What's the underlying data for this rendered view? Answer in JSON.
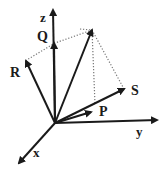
{
  "diagram": {
    "type": "3d-vector-diagram",
    "stroke_color": "#1a1a1a",
    "dotted_color": "#777777",
    "origin": [
      55,
      123
    ],
    "axes": [
      {
        "id": "z",
        "label": "z",
        "tip": [
          53,
          10
        ],
        "label_pos": [
          40,
          22
        ]
      },
      {
        "id": "y",
        "label": "y",
        "tip": [
          157,
          120
        ],
        "label_pos": [
          136,
          136
        ]
      },
      {
        "id": "x",
        "label": "x",
        "tip": [
          19,
          163
        ],
        "label_pos": [
          33,
          157
        ]
      }
    ],
    "vectors": [
      {
        "id": "Q",
        "label": "Q",
        "tip": [
          54,
          43
        ],
        "label_pos": [
          37,
          41
        ]
      },
      {
        "id": "R",
        "label": "R",
        "tip": [
          26,
          61
        ],
        "label_pos": [
          10,
          77
        ]
      },
      {
        "id": "S",
        "label": "S",
        "tip": [
          124,
          89
        ],
        "label_pos": [
          131,
          95
        ]
      },
      {
        "id": "P",
        "label": "P",
        "tip": [
          91,
          112
        ],
        "label_pos": [
          99,
          116
        ]
      },
      {
        "id": "resultant",
        "label": "",
        "tip": [
          92,
          30
        ],
        "label_pos": null
      }
    ],
    "dotted_lines": [
      {
        "from": [
          92,
          30
        ],
        "to": [
          55,
          43
        ]
      },
      {
        "from": [
          55,
          43
        ],
        "to": [
          25,
          61
        ]
      },
      {
        "from": [
          92,
          30
        ],
        "to": [
          95,
          104
        ]
      },
      {
        "from": [
          92,
          30
        ],
        "to": [
          124,
          89
        ]
      },
      {
        "from": [
          80,
          29
        ],
        "to": [
          92,
          30
        ]
      }
    ]
  }
}
